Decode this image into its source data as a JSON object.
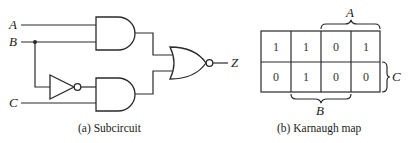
{
  "subcircuit": {
    "inputs": [
      {
        "label": "A"
      },
      {
        "label": "B"
      },
      {
        "label": "C"
      }
    ],
    "output": {
      "label": "Z"
    },
    "gates": [
      "AND (A,B)",
      "NOT (B)",
      "AND (NOT B, C)",
      "NOR"
    ],
    "caption": "(a)  Subcircuit"
  },
  "kmap": {
    "rows": [
      [
        "1",
        "1",
        "0",
        "1"
      ],
      [
        "0",
        "1",
        "0",
        "0"
      ]
    ],
    "brace_labels": {
      "top": "A",
      "bottom": "B",
      "right": "C"
    },
    "caption": "(b)  Karnaugh map"
  }
}
